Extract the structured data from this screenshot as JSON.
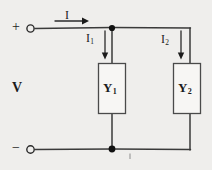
{
  "diagram": {
    "colors": {
      "background": "#efeeec",
      "wire": "#2b2b2b",
      "node": "#111111",
      "text": "#1b1b1b",
      "box_fill": "#f7f6f4"
    },
    "labels": {
      "source_voltage": "V",
      "terminal_positive": "+",
      "terminal_negative": "−",
      "total_current": "I",
      "branch1_current_main": "I",
      "branch1_current_sub": "1",
      "branch2_current_main": "I",
      "branch2_current_sub": "2",
      "admittance1_main": "Y",
      "admittance1_sub": "1",
      "admittance2_main": "Y",
      "admittance2_sub": "2"
    },
    "components": [
      {
        "name": "admittance-y1",
        "label": "Y1",
        "x": 98,
        "y": 63,
        "width": 27,
        "height": 50
      },
      {
        "name": "admittance-y2",
        "label": "Y2",
        "x": 173,
        "y": 63,
        "width": 27,
        "height": 50
      }
    ],
    "nodes": [
      {
        "name": "top-junction-node",
        "x": 112,
        "y": 28
      },
      {
        "name": "bottom-junction-node",
        "x": 112,
        "y": 149
      }
    ],
    "terminals": [
      {
        "name": "positive-terminal",
        "x": 30,
        "y": 28,
        "sign": "+"
      },
      {
        "name": "negative-terminal",
        "x": 30,
        "y": 149,
        "sign": "−"
      }
    ],
    "current_arrows": [
      {
        "name": "current-arrow-I",
        "label": "I",
        "direction": "right",
        "x1": 55,
        "y1": 21,
        "x2": 89,
        "y2": 21
      },
      {
        "name": "current-arrow-I1",
        "label": "I1",
        "direction": "down",
        "x1": 105,
        "y1": 31,
        "x2": 105,
        "y2": 59
      },
      {
        "name": "current-arrow-I2",
        "label": "I2",
        "direction": "down",
        "x1": 181,
        "y1": 31,
        "x2": 181,
        "y2": 59
      }
    ]
  }
}
